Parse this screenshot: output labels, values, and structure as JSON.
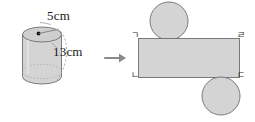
{
  "figure": {
    "background_color": "#ffffff",
    "stroke_color": "#6b6b6b",
    "fill_color": "#d3d3d3",
    "text_color": "#1b1b1b"
  },
  "cylinder": {
    "name": "cylinder-solid",
    "radius_label": "5cm",
    "height_label": "13cm",
    "center_dot": "center-point",
    "radius_leader": "radius-leader-line",
    "height_arc": "height-arc-line"
  },
  "arrow": {
    "name": "transform-arrow",
    "glyph": "→"
  },
  "net": {
    "name": "cylinder-net",
    "top_circle": "top-base-circle",
    "bottom_circle": "bottom-base-circle",
    "rectangle": "lateral-surface-rectangle",
    "corners": {
      "top_left": "ㄱ",
      "top_right": "ㄹ",
      "bottom_left": "ㄴ",
      "bottom_right": "ㄷ"
    }
  }
}
